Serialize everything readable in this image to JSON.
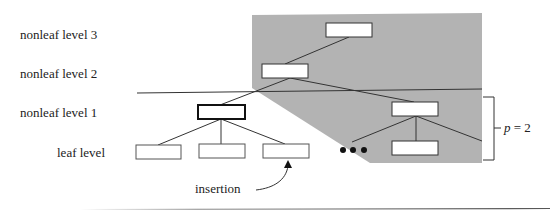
{
  "diagram": {
    "type": "b-tree-insertion",
    "level_labels": [
      {
        "id": "nonleaf-3",
        "text": "nonleaf level 3"
      },
      {
        "id": "nonleaf-2",
        "text": "nonleaf level 2"
      },
      {
        "id": "nonleaf-1",
        "text": "nonleaf level 1"
      },
      {
        "id": "leaf",
        "text": "leaf level"
      }
    ],
    "insertion_label": "insertion",
    "bracket_label_var": "p",
    "bracket_label_rest": " = 2",
    "ellipsis": "•••",
    "colors": {
      "shade": "#b3b3b3",
      "node_fill": "#ffffff",
      "stroke": "#333333"
    }
  }
}
